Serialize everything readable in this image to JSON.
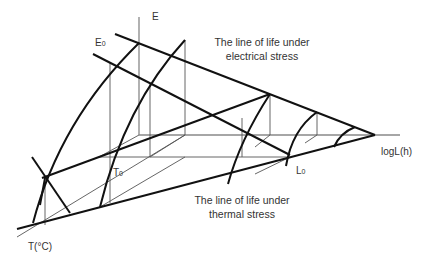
{
  "figure": {
    "type": "3D life surface diagram",
    "axes": {
      "vertical": "E",
      "horizontal": "logL(h)",
      "depth": "T(°C)"
    },
    "points": {
      "E0": {
        "base": "E",
        "sub": "0"
      },
      "T0": {
        "base": "T",
        "sub": "0"
      },
      "L0": {
        "base": "L",
        "sub": "0"
      }
    },
    "captions": {
      "electrical": [
        "The line of life under",
        "electrical stress"
      ],
      "thermal": [
        "The line of life under",
        "thermal stress"
      ]
    },
    "colors": {
      "thick_line": "#111111",
      "thin_line": "#555555",
      "axis_line": "#888888",
      "text": "#333333"
    }
  }
}
